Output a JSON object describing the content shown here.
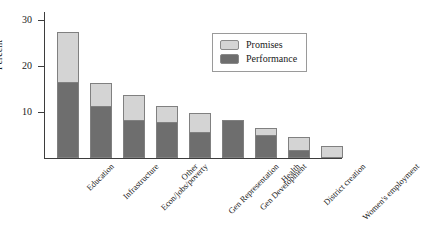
{
  "chart_data": {
    "type": "bar",
    "title": "",
    "subtitle": "",
    "xlabel": "",
    "ylabel": "Percent",
    "stacked": true,
    "grid": false,
    "ylim": [
      0,
      31
    ],
    "yticks": [
      10,
      20,
      30
    ],
    "ytick_labels": [
      "10",
      "20",
      "30"
    ],
    "legend_position": "top-right",
    "categories": [
      "Education",
      "Infrastructure",
      "Econ/jobs/poverty",
      "Other",
      "Gen Representation",
      "Gen Development",
      "Health",
      "District creation",
      "Women's employment"
    ],
    "series": [
      {
        "name": "Performance",
        "color": "#6e6e6e",
        "values": [
          16.5,
          11.2,
          8.2,
          7.8,
          5.7,
          8.3,
          5.0,
          1.8,
          0.0
        ]
      },
      {
        "name": "Promises",
        "color": "#d4d4d4",
        "values": [
          10.9,
          5.1,
          5.6,
          3.5,
          4.1,
          0.0,
          1.5,
          2.8,
          2.6
        ]
      }
    ],
    "totals": [
      27.4,
      16.3,
      13.8,
      11.3,
      9.8,
      8.3,
      6.5,
      4.6,
      2.6
    ]
  },
  "axis": {
    "y_title": "Percent",
    "ticks": [
      {
        "label": "30",
        "value": 30
      },
      {
        "label": "20",
        "value": 20
      },
      {
        "label": "10",
        "value": 10
      }
    ]
  },
  "legend": {
    "entries": [
      {
        "label": "Promises",
        "color": "#d4d4d4"
      },
      {
        "label": "Performance",
        "color": "#6e6e6e"
      }
    ]
  },
  "colors": {
    "promises": "#d4d4d4",
    "performance": "#6e6e6e",
    "bar_outline": "#808080",
    "axis": "#3d3d3d",
    "text": "#1a1a1a",
    "background": "#ffffff"
  }
}
